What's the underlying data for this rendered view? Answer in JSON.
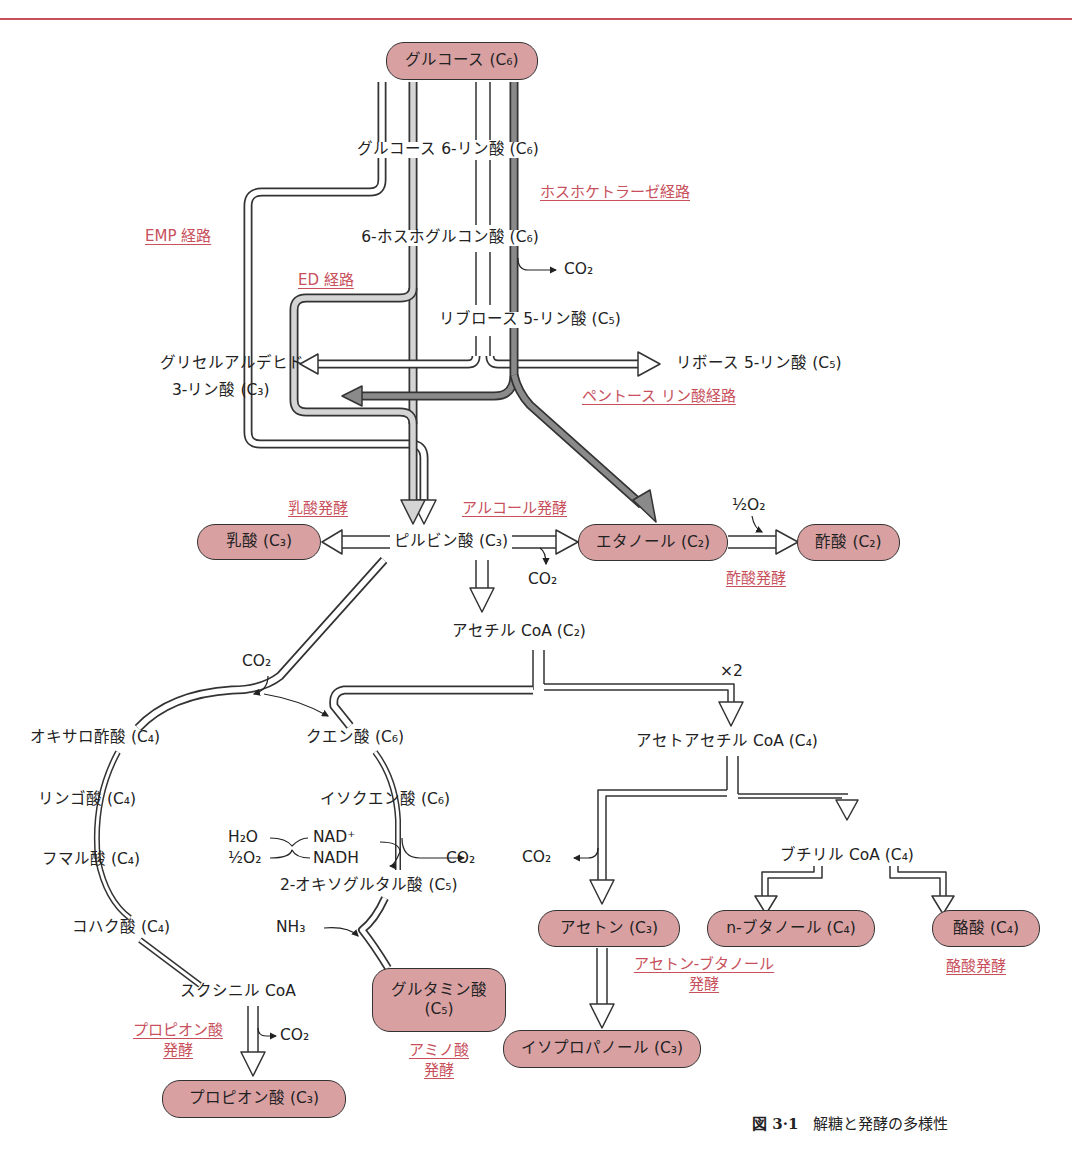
{
  "figure": {
    "caption_number": "図 3·1",
    "caption_title": "解糖と発酵の多様性"
  },
  "nodes": {
    "glucose": "グルコース (C₆)",
    "lactate": "乳酸 (C₃)",
    "ethanol": "エタノール (C₂)",
    "acetate": "酢酸 (C₂)",
    "acetone": "アセトン (C₃)",
    "n_butanol": "n-ブタノール (C₄)",
    "butyrate": "酪酸 (C₄)",
    "glutamate_line1": "グルタミン酸",
    "glutamate_line2": "(C₅)",
    "isopropanol": "イソプロパノール (C₃)",
    "propionate": "プロピオン酸 (C₃)"
  },
  "intermediates": {
    "g6p": "グルコース 6-リン酸 (C₆)",
    "phosphogluconate": "6-ホスホグルコン酸 (C₆)",
    "ribulose5p": "リブロース 5-リン酸 (C₅)",
    "ga3p_line1": "グリセルアルデヒド",
    "ga3p_line2": "3-リン酸 (C₃)",
    "ribose5p": "リボース 5-リン酸 (C₅)",
    "pyruvate": "ピルビン酸 (C₃)",
    "acetyl_coa": "アセチル CoA (C₂)",
    "acetoacetyl_coa": "アセトアセチル CoA (C₄)",
    "butyryl_coa": "ブチリル CoA (C₄)",
    "oxaloacetate": "オキサロ酢酸 (C₄)",
    "citrate": "クエン酸 (C₆)",
    "malate": "リンゴ酸 (C₄)",
    "isocitrate": "イソクエン酸 (C₆)",
    "fumarate": "フマル酸 (C₄)",
    "oxoglutarate": "2-オキソグルタル酸 (C₅)",
    "succinate": "コハク酸 (C₄)",
    "succinyl_coa": "スクシニル CoA"
  },
  "small_labels": {
    "co2": "CO₂",
    "half_o2": "½O₂",
    "times2": "×2",
    "h2o": "H₂O",
    "nad_plus": "NAD⁺",
    "nadh": "NADH",
    "nh3": "NH₃"
  },
  "pathway_names": {
    "emp": "EMP 経路",
    "ed": "ED 経路",
    "phosphoketolase": "ホスホケトラーゼ経路",
    "pentose_phosphate": "ペントース リン酸経路",
    "lactic": "乳酸発酵",
    "alcoholic": "アルコール発酵",
    "acetic": "酢酸発酵",
    "acetone_butanol_line1": "アセトン-ブタノール",
    "acetone_butanol_line2": "発酵",
    "butyric": "酪酸発酵",
    "propionic_line1": "プロピオン酸",
    "propionic_line2": "発酵",
    "amino_acid_line1": "アミノ酸",
    "amino_acid_line2": "発酵"
  },
  "colors": {
    "accent_red": "#c8505c",
    "node_fill": "#d9a0a2",
    "ed_fill": "#d4d4d4",
    "pentose_fill": "#8a8a8a"
  }
}
